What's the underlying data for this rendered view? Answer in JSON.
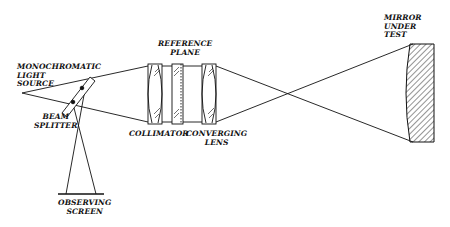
{
  "diagram": {
    "type": "optical-interferometer-setup",
    "labels": {
      "light_source": "MONOCHROMATIC\nLIGHT\nSOURCE",
      "beam_splitter": "BEAM\nSPLITTER",
      "observing_screen": "OBSERVING\nSCREEN",
      "reference_plane": "REFERENCE\nPLANE",
      "collimator": "COLLIMATOR",
      "converging_lens": "CONVERGING\nLENS",
      "mirror": "MIRROR\nUNDER\nTEST"
    },
    "components": [
      {
        "id": "light-source",
        "name": "Monochromatic light source"
      },
      {
        "id": "beam-splitter",
        "name": "Beam splitter"
      },
      {
        "id": "observing-screen",
        "name": "Observing screen"
      },
      {
        "id": "collimator",
        "name": "Collimator"
      },
      {
        "id": "reference-plane",
        "name": "Reference plane"
      },
      {
        "id": "converging-lens",
        "name": "Converging lens"
      },
      {
        "id": "mirror-under-test",
        "name": "Mirror under test"
      }
    ],
    "colors": {
      "line": "#111111",
      "background": "#ffffff"
    }
  }
}
